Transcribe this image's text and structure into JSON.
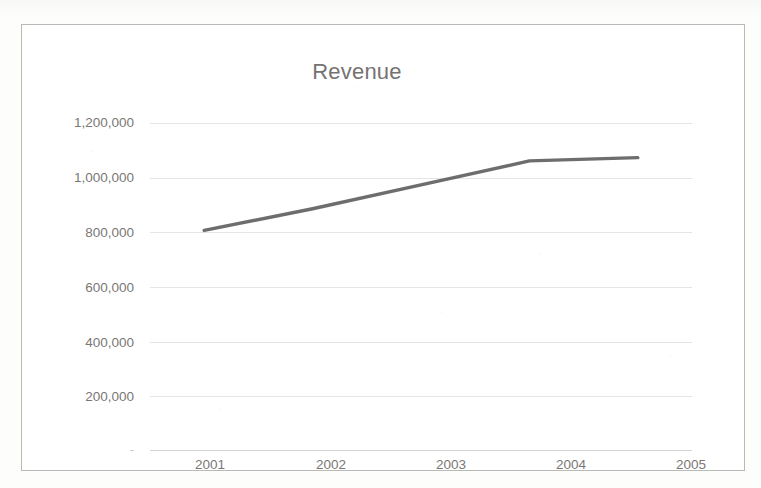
{
  "chart_data": {
    "type": "line",
    "title": "Revenue",
    "xlabel": "",
    "ylabel": "",
    "categories": [
      "2001",
      "2002",
      "2003",
      "2004",
      "2005"
    ],
    "series": [
      {
        "name": "Revenue",
        "values": [
          752000,
          826000,
          907000,
          989000,
          1000000
        ],
        "color": "#595959",
        "line_width": 3,
        "markers": false
      }
    ],
    "ylim": [
      0,
      1200000
    ],
    "y_ticks": [
      0,
      200000,
      400000,
      600000,
      800000,
      1000000,
      1200000
    ],
    "y_tick_labels": [
      "-",
      "200,000",
      "400,000",
      "600,000",
      "800,000",
      "1,000,000",
      "1,200,000"
    ],
    "grid": true,
    "grid_axis": "y",
    "legend": false,
    "legend_position": "none",
    "plot_background": "#ffffff",
    "grid_color": "#e6e5e2",
    "text_color": "#7a7775",
    "border_color": "#b9b9b6"
  },
  "chart": {
    "title": "Revenue",
    "y_axis": {
      "labels": [
        "1,200,000",
        "1,000,000",
        "800,000",
        "600,000",
        "400,000",
        "200,000",
        "-"
      ]
    },
    "x_axis": {
      "labels": [
        "2001",
        "2002",
        "2003",
        "2004",
        "2005"
      ]
    }
  }
}
